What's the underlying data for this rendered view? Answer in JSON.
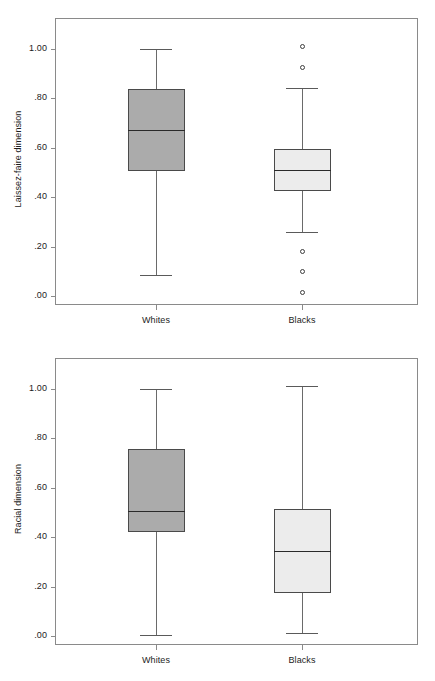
{
  "figure": {
    "title": "",
    "panel_count": 2
  },
  "chart_data": [
    {
      "type": "box",
      "title": "",
      "xlabel": "",
      "ylabel": "Laissez-faire dimension",
      "ylim": [
        0.0,
        1.0
      ],
      "ytick_labels": [
        "1.00",
        ".80",
        ".60",
        ".40",
        ".20",
        ".00"
      ],
      "ytick_values": [
        1.0,
        0.8,
        0.6,
        0.4,
        0.2,
        0.0
      ],
      "grid": false,
      "legend": "none",
      "categories": [
        "Whites",
        "Blacks"
      ],
      "boxes": [
        {
          "category": "Whites",
          "fill_color": "#ababab",
          "whisker_low": 0.085,
          "q1": 0.505,
          "median": 0.67,
          "q3": 0.835,
          "whisker_high": 1.0,
          "outliers": []
        },
        {
          "category": "Blacks",
          "fill_color": "#ececec",
          "whisker_low": 0.26,
          "q1": 0.425,
          "median": 0.51,
          "q3": 0.595,
          "whisker_high": 0.84,
          "outliers": [
            1.01,
            0.925,
            0.18,
            0.1,
            0.015
          ]
        }
      ]
    },
    {
      "type": "box",
      "title": "",
      "xlabel": "",
      "ylabel": "Racial dimension",
      "ylim": [
        0.0,
        1.0
      ],
      "ytick_labels": [
        "1.00",
        ".80",
        ".60",
        ".40",
        ".20",
        ".00"
      ],
      "ytick_values": [
        1.0,
        0.8,
        0.6,
        0.4,
        0.2,
        0.0
      ],
      "grid": false,
      "legend": "none",
      "categories": [
        "Whites",
        "Blacks"
      ],
      "boxes": [
        {
          "category": "Whites",
          "fill_color": "#ababab",
          "whisker_low": 0.005,
          "q1": 0.42,
          "median": 0.505,
          "q3": 0.755,
          "whisker_high": 1.0,
          "outliers": []
        },
        {
          "category": "Blacks",
          "fill_color": "#ececec",
          "whisker_low": 0.012,
          "q1": 0.175,
          "median": 0.345,
          "q3": 0.515,
          "whisker_high": 1.01,
          "outliers": []
        }
      ]
    }
  ]
}
